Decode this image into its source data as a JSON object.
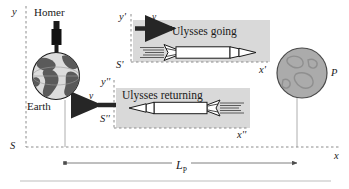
{
  "figure": {
    "title": "",
    "colors": {
      "ink": "#1a1a1a",
      "dash": "#8c8c8c",
      "panel_fill": "#d9d9d9",
      "earth_fill": "#d4d4d4",
      "earth_land": "#4d4d4d",
      "planet_fill": "#a8a8a8",
      "arrow": "#262626",
      "rule": "#d0d0d0"
    },
    "frames": {
      "rest": {
        "name": "S",
        "y_axis_label": "y",
        "x_axis_label": "x"
      },
      "going": {
        "name": "S'",
        "y_axis_label": "y'",
        "x_axis_label": "x'"
      },
      "returning": {
        "name": "S''",
        "y_axis_label": "y''",
        "x_axis_label": "x''"
      }
    },
    "objects": {
      "observer": "Homer",
      "earth": "Earth",
      "planet": "P",
      "ship_going": "Ulysses going",
      "ship_returning": "Ulysses returning"
    },
    "velocity_label": "v",
    "distance": {
      "label": "L",
      "subscript": "P",
      "full": "L_P"
    }
  }
}
